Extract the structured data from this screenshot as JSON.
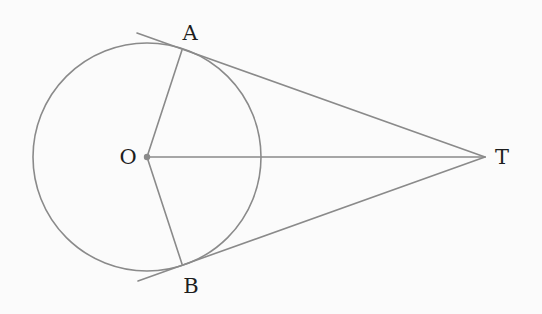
{
  "diagram": {
    "colors": {
      "background": "#fbfbfb",
      "stroke": "#8a8a8a",
      "label": "#1e1e1e"
    },
    "circle": {
      "center_label": "O",
      "cx": 147,
      "cy": 157,
      "r": 114
    },
    "points": {
      "O": {
        "label": "O",
        "x": 147,
        "y": 157,
        "label_x": 128,
        "label_y": 158
      },
      "A": {
        "label": "A",
        "x": 182,
        "y": 50,
        "label_x": 190,
        "label_y": 34
      },
      "B": {
        "label": "B",
        "x": 182,
        "y": 264,
        "label_x": 191,
        "label_y": 287
      },
      "T": {
        "label": "T",
        "x": 485,
        "y": 157,
        "label_x": 502,
        "label_y": 158
      }
    },
    "segments": [
      {
        "name": "tangent-TA",
        "from": "T",
        "x1": 485,
        "y1": 157,
        "x2": 137,
        "y2": 33
      },
      {
        "name": "tangent-TB",
        "from": "T",
        "x1": 485,
        "y1": 157,
        "x2": 138,
        "y2": 281
      },
      {
        "name": "radius-OA",
        "x1": 147,
        "y1": 157,
        "x2": 182,
        "y2": 50
      },
      {
        "name": "radius-OB",
        "x1": 147,
        "y1": 157,
        "x2": 182,
        "y2": 264
      },
      {
        "name": "segment-OT",
        "x1": 147,
        "y1": 157,
        "x2": 485,
        "y2": 157
      }
    ]
  }
}
